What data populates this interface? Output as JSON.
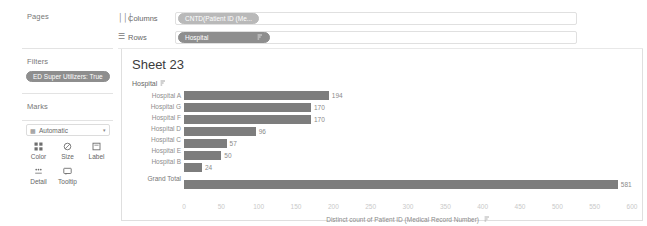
{
  "left_panel": {
    "pages_label": "Pages",
    "filters_label": "Filters",
    "filter_pill": "ED Super Utilizers: True",
    "marks_label": "Marks",
    "marks_type": {
      "icon": "automatic-mark-icon",
      "label": "Automatic",
      "caret": "caret-down-icon"
    },
    "mark_buttons": [
      {
        "name": "color",
        "label": "Color",
        "icon": "color-palette-icon"
      },
      {
        "name": "size",
        "label": "Size",
        "icon": "size-circle-icon"
      },
      {
        "name": "label",
        "label": "Label",
        "icon": "label-tag-icon"
      },
      {
        "name": "detail",
        "label": "Detail",
        "icon": "detail-dots-icon"
      },
      {
        "name": "tooltip",
        "label": "Tooltip",
        "icon": "tooltip-bubble-icon"
      }
    ]
  },
  "shelves": {
    "columns": {
      "icon": "columns-icon",
      "label": "Columns",
      "pill": "CNTD(Patient ID (Me..."
    },
    "rows": {
      "icon": "rows-icon",
      "label": "Rows",
      "pill": "Hospital",
      "pill_sort_icon": "sort-descending-icon"
    }
  },
  "view": {
    "sheet_title": "Sheet 23",
    "row_field_header": "Hospital",
    "row_field_sort_icon": "sort-descending-icon"
  },
  "chart_data": {
    "type": "bar",
    "title": "Sheet 23",
    "orientation": "horizontal",
    "categories": [
      "Hospital A",
      "Hospital G",
      "Hospital F",
      "Hospital D",
      "Hospital C",
      "Hospital E",
      "Hospital B",
      "Grand Total"
    ],
    "values": [
      194,
      170,
      170,
      96,
      57,
      50,
      24,
      581
    ],
    "value_labels": [
      "194",
      "170",
      "170",
      "96",
      "57",
      "50",
      "24",
      "581"
    ],
    "xlabel": "Distinct count of Patient ID (Medical Record Number)",
    "ylabel": "Hospital",
    "xlim": [
      0,
      600
    ],
    "xticks": [
      0,
      50,
      100,
      150,
      200,
      250,
      300,
      350,
      400,
      450,
      500,
      550,
      600
    ],
    "xtick_labels": [
      "0",
      "50",
      "100",
      "150",
      "200",
      "250",
      "300",
      "350",
      "400",
      "450",
      "500",
      "550",
      "600"
    ],
    "grid": false,
    "legend": "none",
    "bar_color": "#7d7d7d"
  }
}
